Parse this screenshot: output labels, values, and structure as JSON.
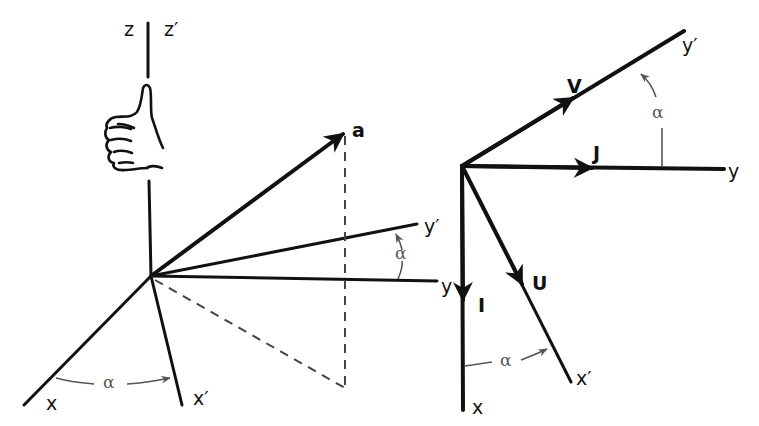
{
  "figure": {
    "left_panel": {
      "labels": {
        "z": "z",
        "z_prime": "z′",
        "x": "x",
        "x_prime": "x′",
        "y": "y",
        "y_prime": "y′",
        "vector_a": "a",
        "alpha_top": "α",
        "alpha_bottom": "α"
      },
      "icons": [
        "right-hand-thumb-up-icon"
      ]
    },
    "right_panel": {
      "labels": {
        "x": "x",
        "x_prime": "x′",
        "y": "y",
        "y_prime": "y′",
        "unit_I": "I",
        "unit_J": "J",
        "unit_U": "U",
        "unit_V": "V",
        "alpha_top": "α",
        "alpha_bottom": "α"
      }
    },
    "colors": {
      "line": "#111111",
      "angle_marker": "#555555",
      "background": "#ffffff"
    }
  }
}
